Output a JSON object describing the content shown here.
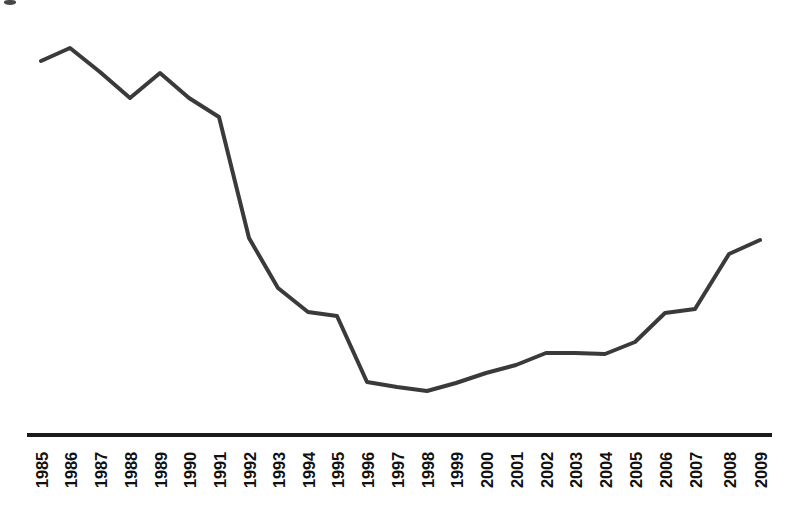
{
  "chart": {
    "type": "line",
    "title": "",
    "xlabel": "",
    "ylabel": "",
    "line_color": "#3a3a3a",
    "line_width": 4,
    "axis_color": "#1a1a1a",
    "background": "#ffffff",
    "grid": false,
    "legend": "none",
    "y_axis_visible": false
  },
  "chart_data": {
    "type": "line",
    "title": "",
    "subtitle": "",
    "xlabel": "",
    "ylabel": "",
    "grid": false,
    "legend_position": "none",
    "categories": [
      "1985",
      "1986",
      "1987",
      "1988",
      "1989",
      "1990",
      "1991",
      "1992",
      "1993",
      "1994",
      "1995",
      "1996",
      "1997",
      "1998",
      "1999",
      "2000",
      "2001",
      "2002",
      "2003",
      "2004",
      "2005",
      "2006",
      "2007",
      "2008",
      "2009"
    ],
    "x": [
      1985,
      1986,
      1987,
      1988,
      1989,
      1990,
      1991,
      1992,
      1993,
      1994,
      1995,
      1996,
      1997,
      1998,
      1999,
      2000,
      2001,
      2002,
      2003,
      2004,
      2005,
      2006,
      2007,
      2008,
      2009
    ],
    "values": [
      96.0,
      99.4,
      93.2,
      87.0,
      93.7,
      87.2,
      76.5,
      46.9,
      34.0,
      28.1,
      27.2,
      10.7,
      9.5,
      8.7,
      10.5,
      12.9,
      14.9,
      17.8,
      17.8,
      17.6,
      20.5,
      28.0,
      28.8,
      42.2,
      45.6
    ],
    "ylim": [
      0,
      105
    ],
    "xlim": [
      1985,
      2009
    ],
    "point_pixels": [
      {
        "year": "1985",
        "x": 41,
        "y": 61
      },
      {
        "year": "1986",
        "x": 70,
        "y": 48
      },
      {
        "year": "1987",
        "x": 100,
        "y": 72
      },
      {
        "year": "1988",
        "x": 130,
        "y": 98
      },
      {
        "year": "1989",
        "x": 160,
        "y": 73
      },
      {
        "year": "1990",
        "x": 189,
        "y": 98
      },
      {
        "year": "1991",
        "x": 219,
        "y": 117
      },
      {
        "year": "1992",
        "x": 249,
        "y": 238
      },
      {
        "year": "1993",
        "x": 278,
        "y": 288
      },
      {
        "year": "1994",
        "x": 308,
        "y": 312
      },
      {
        "year": "1995",
        "x": 337,
        "y": 316
      },
      {
        "year": "1996",
        "x": 367,
        "y": 382
      },
      {
        "year": "1997",
        "x": 397,
        "y": 387
      },
      {
        "year": "1998",
        "x": 427,
        "y": 391
      },
      {
        "year": "1999",
        "x": 456,
        "y": 383
      },
      {
        "year": "2000",
        "x": 486,
        "y": 373
      },
      {
        "year": "2001",
        "x": 516,
        "y": 365
      },
      {
        "year": "2002",
        "x": 546,
        "y": 353
      },
      {
        "year": "2003",
        "x": 575,
        "y": 353
      },
      {
        "year": "2004",
        "x": 605,
        "y": 354
      },
      {
        "year": "2005",
        "x": 635,
        "y": 342
      },
      {
        "year": "2006",
        "x": 665,
        "y": 313
      },
      {
        "year": "2007",
        "x": 695,
        "y": 309
      },
      {
        "year": "2008",
        "x": 729,
        "y": 254
      },
      {
        "year": "2009",
        "x": 760,
        "y": 240
      }
    ],
    "axis_rule": {
      "x1": 27,
      "x2": 772,
      "y": 435,
      "thickness": 4
    }
  }
}
